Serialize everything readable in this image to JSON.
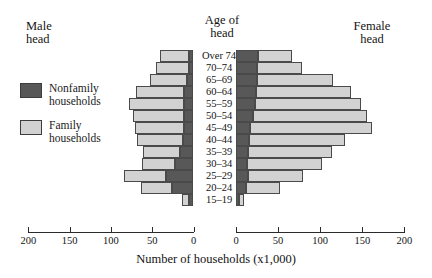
{
  "headings": {
    "male": "Male\nhead",
    "age": "Age of\nhead",
    "female": "Female\nhead"
  },
  "legend": {
    "position": "left",
    "items": [
      {
        "label": "Nonfamily\nhouseholds",
        "color": "#585858",
        "key": "nonfamily"
      },
      {
        "label": "Family\nhouseholds",
        "color": "#d2d2d2",
        "key": "family"
      }
    ]
  },
  "axis": {
    "title": "Number of households (x1,000)",
    "left_ticks": [
      "200",
      "150",
      "100",
      "50",
      "0"
    ],
    "right_ticks": [
      "0",
      "50",
      "100",
      "150",
      "200"
    ],
    "max": 200,
    "tick_step": 50
  },
  "chart_data": {
    "type": "bar",
    "subtype": "population-pyramid",
    "title": "",
    "xlabel": "Number of households (x1,000)",
    "ylabel": "Age of head",
    "xlim": [
      0,
      200
    ],
    "grid": false,
    "legend_position": "left",
    "categories": [
      "Over 74",
      "70–74",
      "65–69",
      "60–64",
      "55–59",
      "50–54",
      "45–49",
      "40–44",
      "35–39",
      "30–34",
      "25–29",
      "20–24",
      "15–19"
    ],
    "sides": [
      {
        "name": "Male head",
        "direction": "left",
        "series": [
          {
            "name": "Nonfamily households",
            "color": "#585858",
            "values": [
              5,
              6,
              8,
              12,
              12,
              11,
              11,
              13,
              16,
              22,
              33,
              26,
              5
            ]
          },
          {
            "name": "Family households",
            "color": "#d2d2d2",
            "values": [
              36,
              40,
              45,
              58,
              66,
              62,
              60,
              55,
              45,
              40,
              51,
              38,
              9
            ]
          }
        ]
      },
      {
        "name": "Female head",
        "direction": "right",
        "series": [
          {
            "name": "Nonfamily households",
            "color": "#585858",
            "values": [
              26,
              25,
              25,
              24,
              22,
              20,
              17,
              15,
              14,
              13,
              14,
              12,
              4
            ]
          },
          {
            "name": "Family households",
            "color": "#d2d2d2",
            "values": [
              40,
              53,
              90,
              113,
              127,
              136,
              145,
              114,
              100,
              89,
              66,
              40,
              6
            ]
          }
        ]
      }
    ],
    "units": "thousands of households"
  }
}
